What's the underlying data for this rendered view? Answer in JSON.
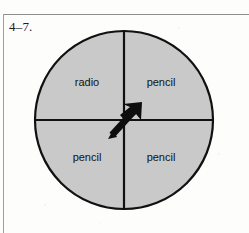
{
  "exercise": {
    "number": "4–7."
  },
  "figure": {
    "type": "spinner-diagram",
    "circle": {
      "center_x": 124,
      "center_y": 120,
      "radius": 89,
      "fill_color": "#c9c9c9",
      "stroke_color": "#111111",
      "stroke_width": 2.2
    },
    "dividers": {
      "vertical": true,
      "horizontal": true,
      "stroke_color": "#111111",
      "stroke_width": 2.2
    },
    "sectors": [
      {
        "name": "top-left",
        "label": "radio",
        "label_x": 87,
        "label_y": 83
      },
      {
        "name": "top-right",
        "label": "pencil",
        "label_x": 161,
        "label_y": 83
      },
      {
        "name": "bottom-left",
        "label": "pencil",
        "label_x": 87,
        "label_y": 158
      },
      {
        "name": "bottom-right",
        "label": "pencil",
        "label_x": 161,
        "label_y": 158
      }
    ],
    "pointer": {
      "name": "spinner-arrow",
      "tail_x": 111,
      "tail_y": 136,
      "tip_x": 141,
      "tip_y": 103,
      "direction": "up-right",
      "points_at": "pencil",
      "color": "#0d0d0d"
    }
  },
  "page_rules": {
    "top_line_color": "#8d8d8d",
    "left_line_color": "#a0a0a0"
  }
}
